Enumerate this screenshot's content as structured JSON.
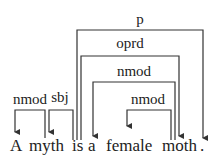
{
  "diagram": {
    "type": "dependency-parse",
    "tokens": [
      {
        "text": "A",
        "x": 16
      },
      {
        "text": "myth",
        "x": 47
      },
      {
        "text": "is",
        "x": 77
      },
      {
        "text": "a",
        "x": 93
      },
      {
        "text": "female",
        "x": 127
      },
      {
        "text": "moth",
        "x": 179
      },
      {
        "text": ".",
        "x": 203
      }
    ],
    "arcs": [
      {
        "label": "p",
        "head": 2,
        "dep": 6
      },
      {
        "label": "oprd",
        "head": 2,
        "dep": 5
      },
      {
        "label": "nmod",
        "head": 5,
        "dep": 3
      },
      {
        "label": "nmod",
        "head": 5,
        "dep": 4
      },
      {
        "label": "nmod",
        "head": 1,
        "dep": 0
      },
      {
        "label": "sbj",
        "head": 2,
        "dep": 1
      }
    ],
    "stroke_color": "#333333",
    "text_color": "#222222"
  }
}
